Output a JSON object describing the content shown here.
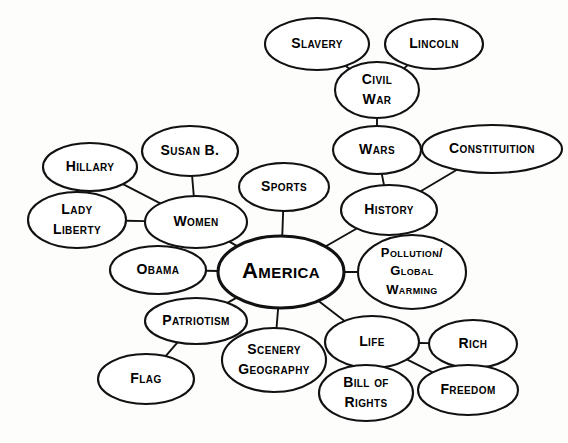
{
  "diagram": {
    "type": "mind-map",
    "background_color": "#fdfdfc",
    "ink_color": "#111111",
    "node_fill": "#ffffff",
    "root": "america",
    "nodes": [
      {
        "id": "america",
        "label": "America",
        "lines": [
          "America"
        ],
        "cx": 281,
        "cy": 272,
        "rx": 63,
        "ry": 36,
        "font_size": 22,
        "root": true
      },
      {
        "id": "slavery",
        "label": "Slavery",
        "lines": [
          "Slavery"
        ],
        "cx": 317,
        "cy": 44,
        "rx": 52,
        "ry": 26,
        "font_size": 14,
        "root": false
      },
      {
        "id": "lincoln",
        "label": "Lincoln",
        "lines": [
          "Lincoln"
        ],
        "cx": 434,
        "cy": 44,
        "rx": 49,
        "ry": 25,
        "font_size": 14,
        "root": false
      },
      {
        "id": "civil-war",
        "label": "Civil War",
        "lines": [
          "Civil",
          "War"
        ],
        "cx": 377,
        "cy": 90,
        "rx": 42,
        "ry": 28,
        "font_size": 14,
        "root": false
      },
      {
        "id": "wars",
        "label": "Wars",
        "lines": [
          "Wars"
        ],
        "cx": 377,
        "cy": 150,
        "rx": 44,
        "ry": 24,
        "font_size": 14,
        "root": false
      },
      {
        "id": "constituition",
        "label": "Constituition",
        "lines": [
          "Constituition"
        ],
        "cx": 492,
        "cy": 149,
        "rx": 70,
        "ry": 24,
        "font_size": 14,
        "root": false
      },
      {
        "id": "history",
        "label": "History",
        "lines": [
          "History"
        ],
        "cx": 389,
        "cy": 210,
        "rx": 48,
        "ry": 25,
        "font_size": 14,
        "root": false
      },
      {
        "id": "pollution",
        "label": "Pollution/ Global Warming",
        "lines": [
          "Pollution/",
          "Global",
          "Warming"
        ],
        "cx": 412,
        "cy": 272,
        "rx": 54,
        "ry": 37,
        "font_size": 13,
        "root": false
      },
      {
        "id": "sports",
        "label": "Sports",
        "lines": [
          "Sports"
        ],
        "cx": 284,
        "cy": 187,
        "rx": 45,
        "ry": 24,
        "font_size": 14,
        "root": false
      },
      {
        "id": "susan-b",
        "label": "Susan B.",
        "lines": [
          "Susan B."
        ],
        "cx": 190,
        "cy": 151,
        "rx": 48,
        "ry": 25,
        "font_size": 14,
        "root": false
      },
      {
        "id": "hillary",
        "label": "Hillary",
        "lines": [
          "Hillary"
        ],
        "cx": 90,
        "cy": 167,
        "rx": 47,
        "ry": 24,
        "font_size": 14,
        "root": false
      },
      {
        "id": "lady-liberty",
        "label": "Lady Liberty",
        "lines": [
          "Lady",
          "Liberty"
        ],
        "cx": 77,
        "cy": 220,
        "rx": 49,
        "ry": 28,
        "font_size": 14,
        "root": false
      },
      {
        "id": "women",
        "label": "Women",
        "lines": [
          "Women"
        ],
        "cx": 196,
        "cy": 222,
        "rx": 51,
        "ry": 26,
        "font_size": 14,
        "root": false
      },
      {
        "id": "obama",
        "label": "Obama",
        "lines": [
          "Obama"
        ],
        "cx": 158,
        "cy": 270,
        "rx": 48,
        "ry": 24,
        "font_size": 14,
        "root": false
      },
      {
        "id": "patriotism",
        "label": "Patriotism",
        "lines": [
          "Patriotism"
        ],
        "cx": 196,
        "cy": 321,
        "rx": 51,
        "ry": 23,
        "font_size": 14,
        "root": false
      },
      {
        "id": "flag",
        "label": "Flag",
        "lines": [
          "Flag"
        ],
        "cx": 146,
        "cy": 379,
        "rx": 48,
        "ry": 25,
        "font_size": 14,
        "root": false
      },
      {
        "id": "scenery",
        "label": "Scenery Geography",
        "lines": [
          "Scenery",
          "Geography"
        ],
        "cx": 274,
        "cy": 360,
        "rx": 52,
        "ry": 32,
        "font_size": 14,
        "root": false
      },
      {
        "id": "life",
        "label": "Life",
        "lines": [
          "Life"
        ],
        "cx": 372,
        "cy": 342,
        "rx": 47,
        "ry": 26,
        "font_size": 14,
        "root": false
      },
      {
        "id": "rich",
        "label": "Rich",
        "lines": [
          "Rich"
        ],
        "cx": 473,
        "cy": 344,
        "rx": 44,
        "ry": 24,
        "font_size": 14,
        "root": false
      },
      {
        "id": "bill-of-rights",
        "label": "Bill of Rights",
        "lines": [
          "Bill of",
          "Rights"
        ],
        "cx": 366,
        "cy": 393,
        "rx": 47,
        "ry": 28,
        "font_size": 14,
        "root": false
      },
      {
        "id": "freedom",
        "label": "Freedom",
        "lines": [
          "Freedom"
        ],
        "cx": 468,
        "cy": 390,
        "rx": 50,
        "ry": 25,
        "font_size": 14,
        "root": false
      }
    ],
    "edges": [
      {
        "from": "slavery",
        "to": "civil-war"
      },
      {
        "from": "lincoln",
        "to": "civil-war"
      },
      {
        "from": "civil-war",
        "to": "wars"
      },
      {
        "from": "wars",
        "to": "history"
      },
      {
        "from": "constituition",
        "to": "history"
      },
      {
        "from": "history",
        "to": "america"
      },
      {
        "from": "sports",
        "to": "america"
      },
      {
        "from": "pollution",
        "to": "america"
      },
      {
        "from": "susan-b",
        "to": "women"
      },
      {
        "from": "hillary",
        "to": "women"
      },
      {
        "from": "lady-liberty",
        "to": "women"
      },
      {
        "from": "women",
        "to": "america"
      },
      {
        "from": "obama",
        "to": "america"
      },
      {
        "from": "patriotism",
        "to": "america"
      },
      {
        "from": "flag",
        "to": "patriotism"
      },
      {
        "from": "scenery",
        "to": "america"
      },
      {
        "from": "life",
        "to": "america"
      },
      {
        "from": "rich",
        "to": "life"
      },
      {
        "from": "freedom",
        "to": "life"
      },
      {
        "from": "bill-of-rights",
        "to": "life"
      }
    ]
  }
}
